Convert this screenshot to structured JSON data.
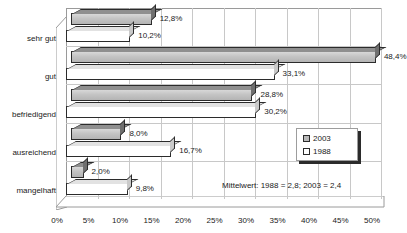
{
  "chart_data": {
    "type": "bar",
    "orientation": "horizontal",
    "title": "",
    "xlabel": "",
    "ylabel": "",
    "xlim": [
      0,
      50
    ],
    "grid": true,
    "legend_position": "center-right",
    "categories": [
      "sehr gut",
      "gut",
      "befriedigend",
      "ausreichend",
      "mangelhaft"
    ],
    "series": [
      {
        "name": "2003",
        "color": "#c4c4c4",
        "values": [
          12.8,
          48.4,
          28.8,
          8.0,
          2.0
        ],
        "value_labels": [
          "12,8%",
          "48,4%",
          "28,8%",
          "8,0%",
          "2,0%"
        ]
      },
      {
        "name": "1988",
        "color": "#ffffff",
        "values": [
          10.2,
          33.1,
          30.2,
          16.7,
          9.8
        ],
        "value_labels": [
          "10,2%",
          "33,1%",
          "30,2%",
          "16,7%",
          "9,8%"
        ]
      }
    ],
    "xticks": [
      0,
      5,
      10,
      15,
      20,
      25,
      30,
      35,
      40,
      45,
      50
    ],
    "xtick_labels": [
      "0%",
      "5%",
      "10%",
      "15%",
      "20%",
      "25%",
      "30%",
      "35%",
      "40%",
      "45%",
      "50%"
    ],
    "annotations": [
      "Mittelwert:  1988 = 2,8; 2003 = 2,4"
    ]
  },
  "legend": {
    "items": [
      {
        "label": "2003"
      },
      {
        "label": "1988"
      }
    ]
  },
  "annotation": {
    "mittelwert": "Mittelwert:  1988 = 2,8; 2003 = 2,4"
  }
}
